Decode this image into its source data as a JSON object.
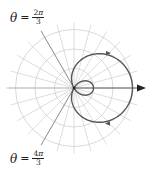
{
  "labels": {
    "top": {
      "theta": "θ",
      "eq": "=",
      "num_coef": "2",
      "num_sym": "π",
      "den": "3"
    },
    "bottom": {
      "theta": "θ",
      "eq": "=",
      "num_coef": "4",
      "num_sym": "π",
      "den": "3"
    }
  },
  "colors": {
    "grid": "#c8c8c8",
    "axis": "#333333",
    "curve": "#555555",
    "highlight_ray": "#888888"
  },
  "chart_data": {
    "type": "polar",
    "equation": "r = 1 + 2cos(θ)",
    "curve_name": "limaçon with inner loop",
    "grid_rings": [
      1,
      2,
      3
    ],
    "spoke_step_deg": 15,
    "max_r": 3,
    "inner_loop_max_r": 1,
    "highlighted_angles": [
      "2π/3",
      "4π/3"
    ],
    "annotations": [
      "θ = 2π/3",
      "θ = 4π/3"
    ],
    "polar_axis_arrow": true
  }
}
